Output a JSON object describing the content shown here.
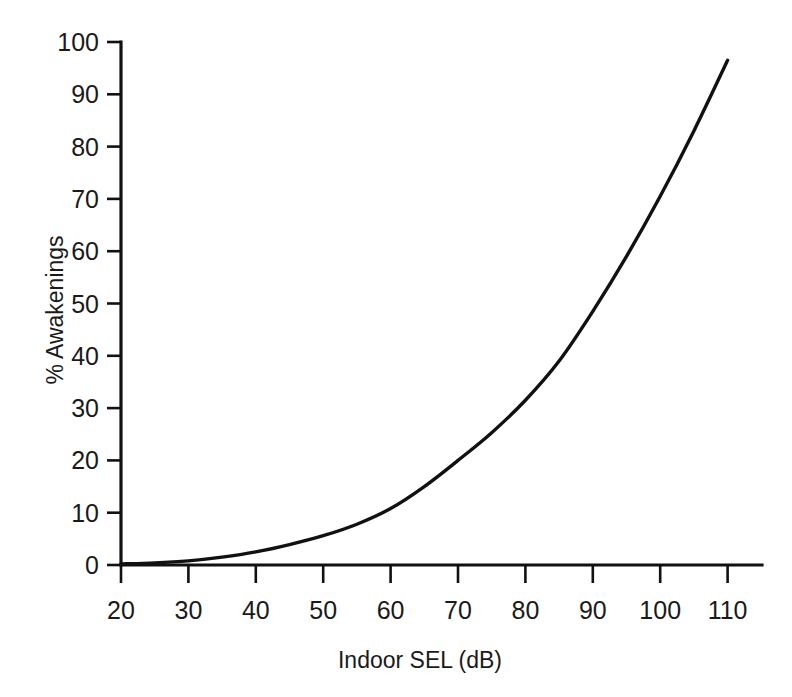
{
  "chart_data": {
    "type": "line",
    "title": "",
    "subtitle": "",
    "xlabel": "Indoor SEL (dB)",
    "ylabel": "% Awakenings",
    "xlim": [
      20,
      115
    ],
    "ylim": [
      0,
      100
    ],
    "xticks": [
      20,
      30,
      40,
      50,
      60,
      70,
      80,
      90,
      100,
      110
    ],
    "yticks": [
      0,
      10,
      20,
      30,
      40,
      50,
      60,
      70,
      80,
      90,
      100
    ],
    "xtick_labels": [
      "20",
      "30",
      "40",
      "50",
      "60",
      "70",
      "80",
      "90",
      "100",
      "110"
    ],
    "ytick_labels": [
      "0",
      "10",
      "20",
      "30",
      "40",
      "50",
      "60",
      "70",
      "80",
      "90",
      "100"
    ],
    "grid": false,
    "legend": null,
    "legend_position": "none",
    "line_color": "#111111",
    "background_color": "#ffffff",
    "series": [
      {
        "name": "% Awakenings vs Indoor SEL",
        "x": [
          20,
          25,
          30,
          35,
          40,
          45,
          50,
          55,
          60,
          65,
          70,
          75,
          80,
          85,
          90,
          95,
          100,
          105,
          110
        ],
        "values": [
          0.2,
          0.4,
          0.8,
          1.5,
          2.5,
          3.9,
          5.6,
          7.8,
          10.8,
          15.0,
          20.0,
          25.3,
          31.5,
          39.0,
          48.5,
          59.0,
          70.5,
          83.0,
          96.5
        ]
      }
    ]
  },
  "axes": {
    "x_title": "Indoor SEL (dB)",
    "y_title": "% Awakenings"
  }
}
